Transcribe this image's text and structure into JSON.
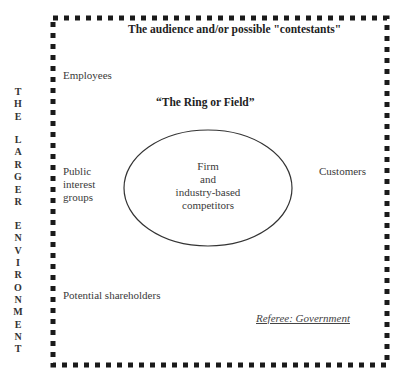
{
  "diagram": {
    "title": "The audience and/or possible \"contestants\"",
    "ring_title": "“The Ring or Field”",
    "vertical_label_letters": [
      "T",
      "H",
      "E",
      "",
      "L",
      "A",
      "R",
      "G",
      "E",
      "R",
      "",
      "E",
      "N",
      "V",
      "I",
      "R",
      "O",
      "N",
      "M",
      "E",
      "N",
      "T"
    ],
    "vertical_label_text": "THE LARGER ENVIRONMENT",
    "audience": {
      "employees": "Employees",
      "public_interest_line1": "Public",
      "public_interest_line2": "interest",
      "public_interest_line3": "groups",
      "customers": "Customers",
      "potential_shareholders": "Potential shareholders"
    },
    "ring": {
      "line1": "Firm",
      "line2": "and",
      "line3": "industry-based",
      "line4": "competitors"
    },
    "referee": "Referee: Government",
    "colors": {
      "border": "#1a1a1a",
      "text": "#333333",
      "background": "#ffffff"
    }
  }
}
